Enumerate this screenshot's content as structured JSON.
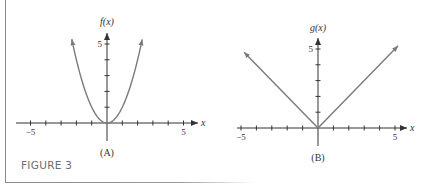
{
  "figure": {
    "caption": "FIGURE 3",
    "panels": [
      {
        "id": "A",
        "label": "(A)",
        "ylabel": "f(x)",
        "xlabel": "x",
        "function": "f(x) = x^2"
      },
      {
        "id": "B",
        "label": "(B)",
        "ylabel": "g(x)",
        "xlabel": "x",
        "function": "g(x) = |x|"
      }
    ]
  },
  "colors": {
    "curve": "#7a7a7a",
    "axis": "#333333",
    "caption": "#6d6d6d",
    "frame": "#8a8a8a"
  },
  "chart_data": [
    {
      "type": "line",
      "title": "(A)",
      "xlabel": "x",
      "ylabel": "f(x)",
      "function": "x^2",
      "x": [
        -2.3,
        -2,
        -1.5,
        -1,
        -0.5,
        0,
        0.5,
        1,
        1.5,
        2,
        2.3
      ],
      "series": [
        {
          "name": "f(x)",
          "values": [
            5.29,
            4,
            2.25,
            1,
            0.25,
            0,
            0.25,
            1,
            2.25,
            4,
            5.29
          ]
        }
      ],
      "xlim": [
        -5.5,
        5.5
      ],
      "ylim": [
        -1,
        5.5
      ],
      "xticks": [
        -5,
        -4,
        -3,
        -2,
        -1,
        0,
        1,
        2,
        3,
        4,
        5
      ],
      "xtick_labels": {
        "-5": "−5",
        "5": "5"
      },
      "yticks": [
        1,
        2,
        3,
        4,
        5
      ],
      "ytick_labels": {
        "5": "5"
      },
      "arrows": "both curve ends and positive axes",
      "grid": false
    },
    {
      "type": "line",
      "title": "(B)",
      "xlabel": "x",
      "ylabel": "g(x)",
      "function": "|x|",
      "x": [
        -4.8,
        0,
        5.2
      ],
      "series": [
        {
          "name": "g(x)",
          "values": [
            4.8,
            0,
            5.2
          ]
        }
      ],
      "xlim": [
        -5.5,
        5.5
      ],
      "ylim": [
        -1,
        5.5
      ],
      "xticks": [
        -5,
        -4,
        -3,
        -2,
        -1,
        0,
        1,
        2,
        3,
        4,
        5
      ],
      "xtick_labels": {
        "-5": "−5",
        "5": "5"
      },
      "yticks": [
        1,
        2,
        3,
        4,
        5
      ],
      "ytick_labels": {
        "5": "5"
      },
      "arrows": "both line ends and positive axes",
      "grid": false
    }
  ]
}
